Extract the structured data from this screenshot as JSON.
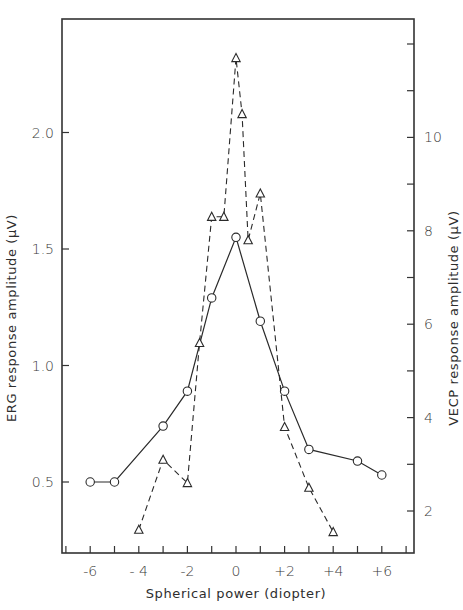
{
  "chart_data": {
    "type": "line",
    "title": "",
    "xlabel": "Spherical power (diopter)",
    "ylabel_left": "ERG response amplitude (µV)",
    "ylabel_right": "VECP response amplitude (µV)",
    "xlim": [
      -7,
      7
    ],
    "ylim_left": [
      0.28,
      2.55
    ],
    "ylim_right": [
      1.2,
      12.5
    ],
    "x_ticks": [
      -7,
      -6,
      -5,
      -4,
      -3,
      -2,
      -1,
      0,
      1,
      2,
      3,
      4,
      5,
      6,
      7
    ],
    "x_tick_labels": [
      {
        "x": -6,
        "label": "-6"
      },
      {
        "x": -4,
        "label": "- 4"
      },
      {
        "x": -2,
        "label": "-2"
      },
      {
        "x": 0,
        "label": "0"
      },
      {
        "x": 2,
        "label": "+2"
      },
      {
        "x": 4,
        "label": "+4"
      },
      {
        "x": 6,
        "label": "+6"
      }
    ],
    "y_left_ticks": [
      {
        "v": 0.5,
        "label": "0.5"
      },
      {
        "v": 1.0,
        "label": "1.0"
      },
      {
        "v": 1.5,
        "label": "1.5"
      },
      {
        "v": 2.0,
        "label": "2.0"
      }
    ],
    "y_right_ticks": [
      2,
      3,
      4,
      5,
      6,
      7,
      8,
      9,
      10,
      11,
      12
    ],
    "y_right_tick_labels": [
      {
        "v": 2,
        "label": "2"
      },
      {
        "v": 4,
        "label": "4"
      },
      {
        "v": 6,
        "label": "6"
      },
      {
        "v": 8,
        "label": "8"
      },
      {
        "v": 10,
        "label": "10"
      }
    ],
    "grid": false,
    "legend": null,
    "series": [
      {
        "name": "ERG",
        "axis": "left",
        "marker": "circle",
        "line_style": "solid",
        "x": [
          -6,
          -5,
          -3,
          -2,
          -1,
          0,
          1,
          2,
          3,
          5,
          6
        ],
        "values": [
          0.5,
          0.5,
          0.74,
          0.89,
          1.29,
          1.55,
          1.19,
          0.89,
          0.64,
          0.59,
          0.53
        ]
      },
      {
        "name": "VECP",
        "axis": "right",
        "marker": "triangle",
        "line_style": "dashed",
        "x": [
          -4,
          -3,
          -2,
          -1.5,
          -1,
          -0.5,
          0,
          0.25,
          0.5,
          1,
          2,
          3,
          4
        ],
        "values": [
          1.6,
          3.1,
          2.6,
          5.6,
          8.3,
          8.3,
          11.7,
          10.5,
          7.8,
          8.8,
          3.8,
          2.5,
          1.55
        ]
      }
    ]
  }
}
